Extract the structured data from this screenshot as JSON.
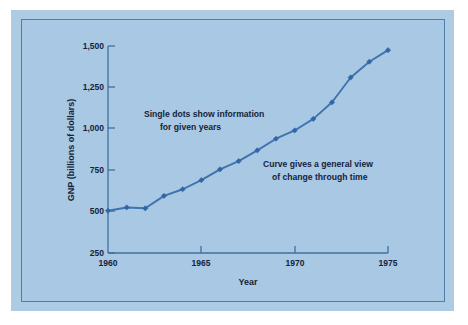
{
  "figure": {
    "background_color": "#ffffff",
    "panel_color": "#aecbe4",
    "plate_color": "#a8c8e3",
    "border_color": "#4a7fae"
  },
  "chart_data": {
    "type": "line",
    "title": "",
    "xlabel": "Year",
    "ylabel": "GNP (billions of dollars)",
    "x": [
      1960,
      1961,
      1962,
      1963,
      1964,
      1965,
      1966,
      1967,
      1968,
      1969,
      1970,
      1971,
      1972,
      1973,
      1974,
      1975
    ],
    "values": [
      505,
      525,
      520,
      595,
      635,
      690,
      755,
      805,
      870,
      940,
      990,
      1060,
      1160,
      1310,
      1405,
      1475
    ],
    "series": [
      {
        "name": "GNP",
        "values": [
          505,
          525,
          520,
          595,
          635,
          690,
          755,
          805,
          870,
          940,
          990,
          1060,
          1160,
          1310,
          1405,
          1475
        ]
      }
    ],
    "xlim": [
      1960,
      1975
    ],
    "ylim": [
      250,
      1500
    ],
    "xticks": [
      1960,
      1965,
      1970,
      1975
    ],
    "xtick_labels": [
      "1960",
      "1965",
      "1970",
      "1975"
    ],
    "yticks": [
      250,
      500,
      750,
      1000,
      1250,
      1500
    ],
    "ytick_labels": [
      "250",
      "500",
      "750",
      "1,000",
      "1,250",
      "1,500"
    ],
    "grid": false,
    "legend": null,
    "line_color": "#3d74ad",
    "marker_color": "#2f66a5",
    "marker": "diamond",
    "annotations": [
      {
        "id": "dots-note",
        "line1": "Single dots show information",
        "line2": "for given years"
      },
      {
        "id": "curve-note",
        "line1": "Curve gives a general view",
        "line2": "of change through time"
      }
    ]
  }
}
